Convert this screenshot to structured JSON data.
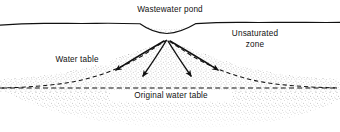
{
  "figure": {
    "type": "cross-section-diagram",
    "width": 340,
    "height": 132,
    "background_color": "#ffffff",
    "line_color": "#111111",
    "stipple_color": "#6d6d6d"
  },
  "labels": {
    "pond": "Wastewater pond",
    "unsaturated_zone_line1": "Unsaturated",
    "unsaturated_zone_line2": "zone",
    "water_table": "Water table",
    "original_water_table": "Original water table"
  },
  "features": {
    "ground_surface": "solid irregular land-surface line across full width, dipping into pond basin",
    "pond_basin": "shallow stippled depression centered near x=167, from x=140 to x=196, bottom at y=33",
    "mounded_water_table": "dashed curve arching upward beneath the pond, merging into the original water table on both sides",
    "original_water_table": "horizontal dashed line at y=88",
    "saturated_zone": "stippled region below the water table with a lobed lower boundary",
    "flow_arrows_count": 4,
    "flow_arrows": "four solid curved arrows fanning downward and outward from a convergence point below the pond"
  }
}
